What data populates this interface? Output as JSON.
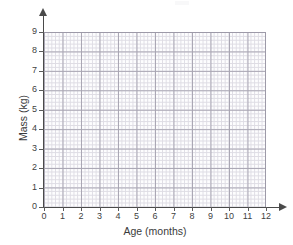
{
  "chart_data": {
    "type": "scatter",
    "title": "",
    "subtitle": "",
    "xlabel": "Age (months)",
    "ylabel": "Mass (kg)",
    "xlim": [
      0,
      12
    ],
    "ylim": [
      0,
      9
    ],
    "x_ticks": [
      "0",
      "1",
      "2",
      "3",
      "4",
      "5",
      "6",
      "7",
      "8",
      "9",
      "10",
      "11",
      "12"
    ],
    "y_ticks": [
      "0",
      "1",
      "2",
      "3",
      "4",
      "5",
      "6",
      "7",
      "8",
      "9"
    ],
    "x_tick_values": [
      0,
      1,
      2,
      3,
      4,
      5,
      6,
      7,
      8,
      9,
      10,
      11,
      12
    ],
    "y_tick_values": [
      0,
      1,
      2,
      3,
      4,
      5,
      6,
      7,
      8,
      9
    ],
    "grid": true,
    "minor_grid": true,
    "minor_subdivisions": 5,
    "legend": null,
    "legend_position": "none",
    "series": [],
    "values": [],
    "x": [],
    "annotations": [],
    "colors": {
      "minor_grid": "#d9d7e0",
      "major_grid": "#a9a6b3",
      "axis": "#4a4a4a",
      "text": "#3b3b3b",
      "plot_background": "#fdfdfe",
      "page_background": "#ffffff"
    }
  },
  "axes": {
    "x_title": "Age (months)",
    "y_title": "Mass (kg)"
  }
}
